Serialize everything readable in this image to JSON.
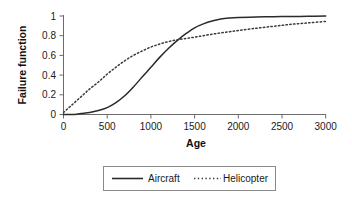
{
  "chart_data": {
    "type": "line",
    "title": "",
    "xlabel": "Age",
    "ylabel": "Failure function",
    "xlim": [
      0,
      3000
    ],
    "ylim": [
      0,
      1
    ],
    "grid": false,
    "legend_position": "bottom",
    "xticks": [
      "0",
      "500",
      "1000",
      "1500",
      "2000",
      "2500",
      "3000"
    ],
    "xtick_values": [
      0,
      500,
      1000,
      1500,
      2000,
      2500,
      3000
    ],
    "yticks": [
      "0",
      "0.2",
      "0.4",
      "0.6",
      "0.8",
      "1"
    ],
    "ytick_values": [
      0,
      0.2,
      0.4,
      0.6,
      0.8,
      1
    ],
    "x": [
      0,
      100,
      200,
      300,
      400,
      500,
      600,
      700,
      800,
      900,
      1000,
      1100,
      1200,
      1300,
      1400,
      1500,
      1600,
      1700,
      1800,
      1900,
      2000,
      2200,
      2400,
      2600,
      2800,
      3000
    ],
    "series": [
      {
        "name": "Aircraft",
        "style": "solid",
        "color": "#2b2b2b",
        "values": [
          0.0,
          0.0,
          0.01,
          0.02,
          0.04,
          0.07,
          0.12,
          0.19,
          0.28,
          0.38,
          0.48,
          0.58,
          0.67,
          0.75,
          0.82,
          0.88,
          0.92,
          0.95,
          0.97,
          0.98,
          0.985,
          0.99,
          0.993,
          0.995,
          0.997,
          0.999
        ]
      },
      {
        "name": "Helicopter",
        "style": "dotted",
        "color": "#3a3a3a",
        "values": [
          0.02,
          0.1,
          0.18,
          0.26,
          0.33,
          0.41,
          0.48,
          0.545,
          0.6,
          0.645,
          0.685,
          0.715,
          0.74,
          0.758,
          0.772,
          0.785,
          0.8,
          0.815,
          0.828,
          0.84,
          0.852,
          0.875,
          0.895,
          0.915,
          0.93,
          0.945
        ]
      }
    ],
    "annotations": {
      "crossover_age": 1320,
      "crossover_value": 0.76
    }
  },
  "legend": {
    "items": [
      {
        "label": "Aircraft",
        "style": "solid"
      },
      {
        "label": "Helicopter",
        "style": "dotted"
      }
    ]
  }
}
